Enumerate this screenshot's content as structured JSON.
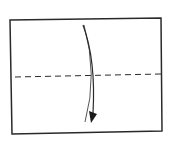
{
  "diagram": {
    "type": "origami-fold-step",
    "colors": {
      "line": "#2a2a2a",
      "background": "#ffffff"
    },
    "paper": {
      "points": "10,20 161,18 162,131 12,134"
    },
    "fold_line": {
      "style": "dashed",
      "x1": 15,
      "y1": 77,
      "x2": 161,
      "y2": 74
    },
    "arrow": {
      "direction": "down",
      "path_outer": "M83,25 Q96,60 93,113",
      "path_inner": "M84,25 Q98,75 85,122"
    }
  }
}
